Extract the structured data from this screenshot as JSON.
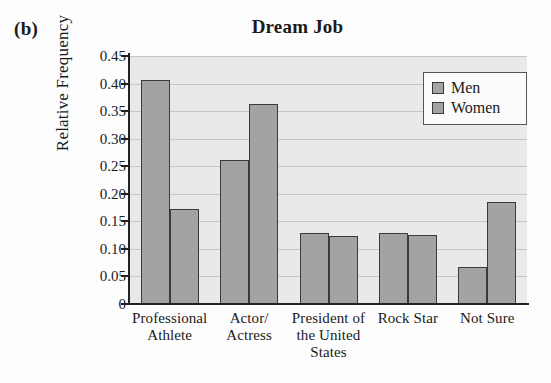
{
  "panel_label": "(b)",
  "chart_data": {
    "type": "bar",
    "title": "Dream Job",
    "xlabel": "",
    "ylabel": "Relative Frequency",
    "ylim": [
      0,
      0.45
    ],
    "grid": true,
    "legend_position": "top-right",
    "y_ticks": [
      {
        "value": 0.45,
        "label": "0.45"
      },
      {
        "value": 0.4,
        "label": "0.40"
      },
      {
        "value": 0.35,
        "label": "0.35"
      },
      {
        "value": 0.3,
        "label": "0.30"
      },
      {
        "value": 0.25,
        "label": "0.25"
      },
      {
        "value": 0.2,
        "label": "0.20"
      },
      {
        "value": 0.15,
        "label": "0.15"
      },
      {
        "value": 0.1,
        "label": "0.10"
      },
      {
        "value": 0.05,
        "label": "0.05"
      },
      {
        "value": 0.0,
        "label": "0"
      }
    ],
    "categories": [
      "Professional Athlete",
      "Actor/ Actress",
      "President of the United States",
      "Rock Star",
      "Not Sure"
    ],
    "category_label_lines": [
      [
        "Professional",
        "Athlete"
      ],
      [
        "Actor/",
        "Actress"
      ],
      [
        "President of",
        "the United",
        "States"
      ],
      [
        "Rock Star"
      ],
      [
        "Not Sure"
      ]
    ],
    "series": [
      {
        "name": "Men",
        "color": "#a3a3a3",
        "values": [
          0.406,
          0.262,
          0.128,
          0.128,
          0.067
        ]
      },
      {
        "name": "Women",
        "color": "#a3a3a3",
        "values": [
          0.173,
          0.363,
          0.123,
          0.125,
          0.185
        ]
      }
    ]
  },
  "legend": {
    "items": [
      {
        "label": "Men"
      },
      {
        "label": "Women"
      }
    ]
  },
  "colors": {
    "bar_fill": "#a3a3a3",
    "bar_border": "#3a3a3a",
    "plot_background": "#e9e9e9",
    "gridline": "#c6c6c6",
    "axis": "#222222"
  }
}
